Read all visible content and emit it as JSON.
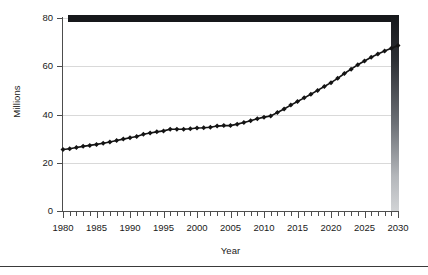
{
  "chart_data": {
    "type": "line",
    "title": "",
    "subtitle": "",
    "xlabel": "Year",
    "ylabel": "Millions",
    "xlim": [
      1980,
      2030
    ],
    "ylim": [
      0,
      80
    ],
    "grid": true,
    "legend_position": "none",
    "marker": "diamond",
    "y_ticks": [
      0,
      20,
      40,
      60,
      80
    ],
    "y_tick_labels": [
      "0",
      "20",
      "40",
      "60",
      "80"
    ],
    "x_ticks": [
      1980,
      1985,
      1990,
      1995,
      2000,
      2005,
      2010,
      2015,
      2020,
      2025,
      2030
    ],
    "x_tick_labels": [
      "1980",
      "1985",
      "1990",
      "1995",
      "2000",
      "2005",
      "2010",
      "2015",
      "2020",
      "2025",
      "2030"
    ],
    "x_minor_tick_interval": 1,
    "annotations": [],
    "x": [
      1980,
      1981,
      1982,
      1983,
      1984,
      1985,
      1986,
      1987,
      1988,
      1989,
      1990,
      1991,
      1992,
      1993,
      1994,
      1995,
      1996,
      1997,
      1998,
      1999,
      2000,
      2001,
      2002,
      2003,
      2004,
      2005,
      2006,
      2007,
      2008,
      2009,
      2010,
      2011,
      2012,
      2013,
      2014,
      2015,
      2016,
      2017,
      2018,
      2019,
      2020,
      2021,
      2022,
      2023,
      2024,
      2025,
      2026,
      2027,
      2028,
      2029,
      2030
    ],
    "series": [
      {
        "name": "Millions",
        "color": "#141414",
        "values": [
          25.5,
          25.8,
          26.3,
          26.8,
          27.2,
          27.6,
          28.1,
          28.6,
          29.2,
          29.8,
          30.4,
          30.9,
          31.8,
          32.3,
          32.8,
          33.2,
          33.9,
          33.9,
          33.9,
          34.1,
          34.4,
          34.5,
          34.7,
          35.2,
          35.4,
          35.4,
          36.0,
          36.7,
          37.4,
          38.2,
          38.9,
          39.4,
          40.8,
          42.3,
          43.9,
          45.4,
          46.9,
          48.4,
          50.0,
          51.6,
          53.2,
          55.0,
          57.0,
          58.8,
          60.6,
          62.2,
          63.7,
          65.1,
          66.3,
          67.5,
          68.6
        ]
      }
    ]
  },
  "decoration": {
    "top_bar_color": "#16181b",
    "right_bar_gradient_top": "#16181b",
    "right_bar_gradient_bottom": "#d2d4d6",
    "axis_color": "#4d4d4d",
    "grid_color": "#d9d9d9",
    "bottom_rule_color": "#3a3a3a"
  }
}
